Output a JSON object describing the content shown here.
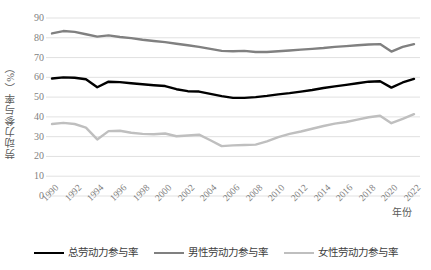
{
  "chart_data": {
    "type": "line",
    "title": "",
    "xlabel": "年份",
    "ylabel": "劳动力参与率（%）",
    "ylim": [
      0,
      90
    ],
    "ytick_step": 10,
    "yticks": [
      "90",
      "80",
      "70",
      "60",
      "50",
      "40",
      "30",
      "20",
      "10",
      "0"
    ],
    "grid": true,
    "grid_axis": "y",
    "legend_position": "bottom",
    "x": [
      1990,
      1991,
      1992,
      1993,
      1994,
      1995,
      1996,
      1997,
      1998,
      1999,
      2000,
      2001,
      2002,
      2003,
      2004,
      2005,
      2006,
      2007,
      2008,
      2009,
      2010,
      2011,
      2012,
      2013,
      2014,
      2015,
      2016,
      2017,
      2018,
      2019,
      2020,
      2021,
      2022
    ],
    "xtick_labels": [
      "1990",
      "1992",
      "1994",
      "1996",
      "1998",
      "2000",
      "2002",
      "2004",
      "2006",
      "2008",
      "2010",
      "2012",
      "2014",
      "2016",
      "2018",
      "2020",
      "2022"
    ],
    "series": [
      {
        "name": "总劳动力参与率",
        "color": "#000000",
        "width": 2.4,
        "values": [
          59.4,
          60.0,
          59.8,
          59.0,
          55.0,
          57.8,
          57.6,
          57.0,
          56.5,
          56.0,
          55.6,
          54.0,
          53.0,
          52.8,
          51.6,
          50.5,
          49.6,
          49.6,
          50.0,
          50.6,
          51.4,
          52.0,
          52.8,
          53.6,
          54.6,
          55.4,
          56.2,
          57.0,
          57.8,
          58.0,
          54.8,
          57.4,
          59.2
        ]
      },
      {
        "name": "男性劳动力参与率",
        "color": "#808080",
        "width": 2.4,
        "values": [
          82.2,
          83.4,
          83.0,
          81.8,
          80.6,
          81.2,
          80.4,
          79.8,
          79.0,
          78.4,
          77.8,
          77.0,
          76.2,
          75.4,
          74.4,
          73.4,
          73.2,
          73.4,
          72.8,
          72.8,
          73.2,
          73.6,
          74.0,
          74.4,
          74.8,
          75.4,
          75.8,
          76.2,
          76.6,
          76.8,
          73.0,
          75.4,
          76.8
        ]
      },
      {
        "name": "女性劳动力参与率",
        "color": "#bfbfbf",
        "width": 2.4,
        "values": [
          36.4,
          37.0,
          36.4,
          34.6,
          28.6,
          32.8,
          33.0,
          32.0,
          31.4,
          31.2,
          31.6,
          30.2,
          30.6,
          31.0,
          28.2,
          25.2,
          25.6,
          25.8,
          26.0,
          27.6,
          29.8,
          31.4,
          32.6,
          34.0,
          35.4,
          36.6,
          37.4,
          38.6,
          39.8,
          40.6,
          36.8,
          39.0,
          41.4
        ]
      }
    ]
  },
  "legend": {
    "items": [
      {
        "label": "总劳动力参与率",
        "color": "#000000"
      },
      {
        "label": "男性劳动力参与率",
        "color": "#808080"
      },
      {
        "label": "女性劳动力参与率",
        "color": "#bfbfbf"
      }
    ]
  },
  "axes": {
    "y_title": "劳动力参与率（%）",
    "x_title": "年份"
  }
}
